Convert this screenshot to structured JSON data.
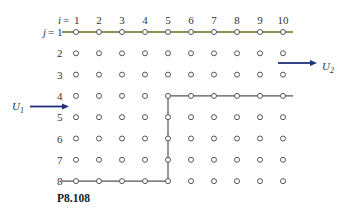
{
  "figure": {
    "label": "P8.108",
    "i_label": "i",
    "j_label": "j",
    "eq": "=",
    "columns": [
      "1",
      "2",
      "3",
      "4",
      "5",
      "6",
      "7",
      "8",
      "9",
      "10"
    ],
    "rows": [
      "1",
      "2",
      "3",
      "4",
      "5",
      "6",
      "7",
      "8"
    ],
    "inflow_label": "U",
    "inflow_sub": "1",
    "outflow_label": "U",
    "outflow_sub": "2",
    "top_wall_color": "#6b6b1e",
    "wall_color": "#555555",
    "arrow_color": "#1f2f7a",
    "row2_label_color": "#b0302a",
    "walls": {
      "top": {
        "row": 1,
        "from_col": 1,
        "to_col": 10
      },
      "upper_right": {
        "row": 4,
        "from_col": 5,
        "to_col": 10
      },
      "step_vertical": {
        "col": 5,
        "from_row": 4,
        "to_row": 8
      },
      "bottom": {
        "row": 8,
        "from_col": 1,
        "to_col": 5
      }
    },
    "inflow_between_rows": [
      4,
      5
    ],
    "outflow_between_rows": [
      2,
      3
    ]
  }
}
